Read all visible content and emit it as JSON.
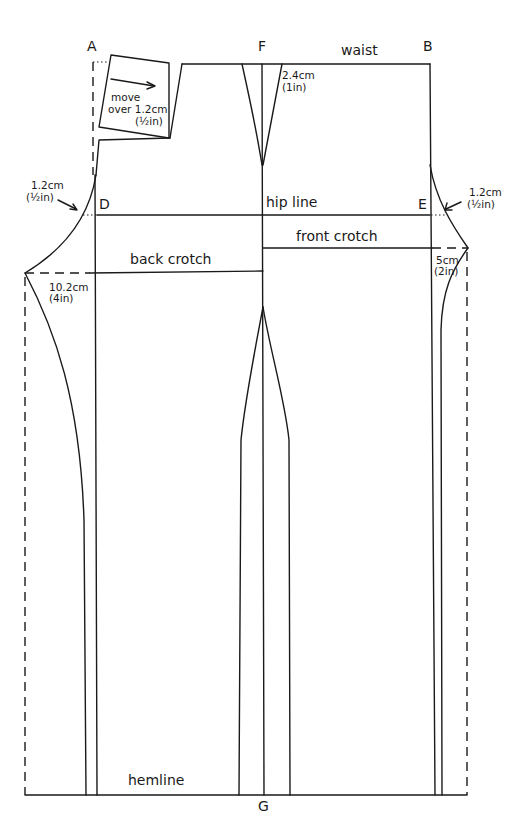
{
  "diagram": {
    "points": {
      "A": "A",
      "B": "B",
      "D": "D",
      "E": "E",
      "F": "F",
      "G": "G"
    },
    "labels": {
      "waist": "waist",
      "hip_line": "hip line",
      "back_crotch": "back crotch",
      "front_crotch": "front crotch",
      "hemline": "hemline"
    },
    "annotations": {
      "move_over": [
        "move",
        "over 1.2cm",
        "(½in)"
      ],
      "dart": [
        "2.4cm",
        "(1in)"
      ],
      "left_hip": [
        "1.2cm",
        "(½in)"
      ],
      "right_hip": [
        "1.2cm",
        "(½in)"
      ],
      "back_crotch_ext": [
        "10.2cm",
        "(4in)"
      ],
      "front_crotch_ext": [
        "5cm",
        "(2in)"
      ]
    },
    "line_color": "#1a1a1a",
    "background": "#ffffff"
  }
}
